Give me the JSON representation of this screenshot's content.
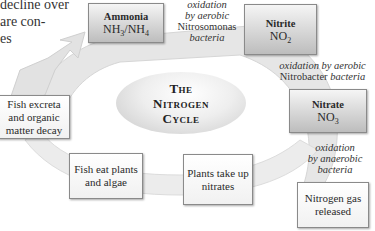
{
  "intro_text": {
    "lines": [
      "decline over",
      "are con-",
      "es"
    ]
  },
  "title": {
    "line1": "The",
    "line2": "Nitrogen",
    "line3": "Cycle"
  },
  "nodes": {
    "ammonia": {
      "name": "Ammonia",
      "formula_a": "NH",
      "sub_a": "3",
      "slash": "/",
      "formula_b": "NH",
      "sub_b": "4"
    },
    "nitrite": {
      "name": "Nitrite",
      "formula": "NO",
      "sub": "2"
    },
    "nitrate": {
      "name": "Nitrate",
      "formula": "NO",
      "sub": "3"
    },
    "nitrogen_gas": {
      "line1": "Nitrogen gas",
      "line2": "released"
    },
    "plants_take_up": {
      "line1": "Plants take up",
      "line2": "nitrates"
    },
    "fish_eat": {
      "line1": "Fish eat plants",
      "line2": "and algae"
    },
    "fish_excreta": {
      "line1": "Fish excreta",
      "line2": "and organic",
      "line3": "matter decay"
    }
  },
  "edge_labels": {
    "ammonia_to_nitrite": {
      "line1": "oxidation",
      "line2": "by aerobic",
      "line3": "Nitrosomonas",
      "line4": "bacteria"
    },
    "nitrite_to_nitrate": {
      "line1": "oxidation by aerobic",
      "line2a": "Nitrobacter",
      "line2b": "bacteria"
    },
    "nitrate_to_nitrogen": {
      "line1": "oxidation",
      "line2": "by anaerobic",
      "line3": "bacteria"
    }
  },
  "colors": {
    "arrow_fill": "#e6e6e6",
    "box_border": "#8a8a8a",
    "dark_box_bottom": "#bdbdbd"
  }
}
